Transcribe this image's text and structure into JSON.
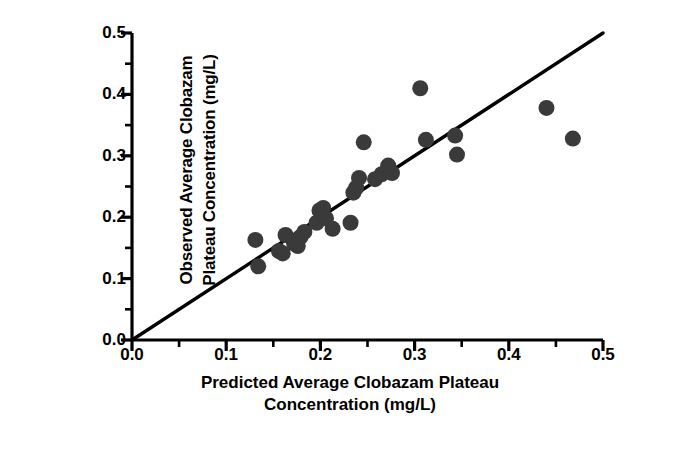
{
  "chart_data": {
    "type": "scatter",
    "title": "",
    "xlabel": "Predicted Average Clobazam Plateau Concentration (mg/L)",
    "xlabel_line1": "Predicted Average Clobazam Plateau",
    "xlabel_line2": "Concentration (mg/L)",
    "ylabel": "Observed Average Clobazam Plateau Concentration (mg/L)",
    "ylabel_line1": "Observed Average Clobazam",
    "ylabel_line2": "Plateau Concentration (mg/L)",
    "xlim": [
      0.0,
      0.5
    ],
    "ylim": [
      0.0,
      0.5
    ],
    "xticks": [
      "0.0",
      "0.1",
      "0.2",
      "0.3",
      "0.4",
      "0.5"
    ],
    "yticks": [
      "0.0",
      "0.1",
      "0.2",
      "0.3",
      "0.4",
      "0.5"
    ],
    "xtick_values": [
      0.0,
      0.1,
      0.2,
      0.3,
      0.4,
      0.5
    ],
    "ytick_values": [
      0.0,
      0.1,
      0.2,
      0.3,
      0.4,
      0.5
    ],
    "minor_tick_interval": 0.05,
    "grid": false,
    "legend": "none",
    "marker_color": "#3a3a3a",
    "marker_size": 11,
    "line_color": "#000000",
    "axis_color": "#000000",
    "reference_line": {
      "label": "line of identity",
      "x": [
        0.0,
        0.5
      ],
      "y": [
        0.0,
        0.5
      ],
      "slope": 1.0,
      "intercept": 0.0
    },
    "n_points": 27,
    "x": [
      0.131,
      0.134,
      0.156,
      0.16,
      0.163,
      0.172,
      0.176,
      0.179,
      0.183,
      0.196,
      0.199,
      0.203,
      0.206,
      0.213,
      0.232,
      0.235,
      0.238,
      0.241,
      0.246,
      0.258,
      0.265,
      0.272,
      0.276,
      0.306,
      0.312,
      0.343,
      0.345,
      0.44,
      0.468
    ],
    "y": [
      0.163,
      0.12,
      0.145,
      0.141,
      0.171,
      0.157,
      0.153,
      0.168,
      0.176,
      0.191,
      0.211,
      0.215,
      0.198,
      0.181,
      0.191,
      0.24,
      0.248,
      0.264,
      0.322,
      0.262,
      0.27,
      0.284,
      0.272,
      0.41,
      0.326,
      0.333,
      0.302,
      0.378,
      0.328
    ],
    "points": [
      {
        "x": 0.131,
        "y": 0.163
      },
      {
        "x": 0.134,
        "y": 0.12
      },
      {
        "x": 0.156,
        "y": 0.145
      },
      {
        "x": 0.16,
        "y": 0.141
      },
      {
        "x": 0.163,
        "y": 0.171
      },
      {
        "x": 0.172,
        "y": 0.157
      },
      {
        "x": 0.176,
        "y": 0.153
      },
      {
        "x": 0.179,
        "y": 0.168
      },
      {
        "x": 0.183,
        "y": 0.176
      },
      {
        "x": 0.196,
        "y": 0.191
      },
      {
        "x": 0.199,
        "y": 0.211
      },
      {
        "x": 0.203,
        "y": 0.215
      },
      {
        "x": 0.206,
        "y": 0.198
      },
      {
        "x": 0.213,
        "y": 0.181
      },
      {
        "x": 0.232,
        "y": 0.191
      },
      {
        "x": 0.235,
        "y": 0.24
      },
      {
        "x": 0.238,
        "y": 0.248
      },
      {
        "x": 0.241,
        "y": 0.264
      },
      {
        "x": 0.246,
        "y": 0.322
      },
      {
        "x": 0.258,
        "y": 0.262
      },
      {
        "x": 0.265,
        "y": 0.27
      },
      {
        "x": 0.272,
        "y": 0.284
      },
      {
        "x": 0.276,
        "y": 0.272
      },
      {
        "x": 0.306,
        "y": 0.41
      },
      {
        "x": 0.312,
        "y": 0.326
      },
      {
        "x": 0.343,
        "y": 0.333
      },
      {
        "x": 0.345,
        "y": 0.302
      },
      {
        "x": 0.44,
        "y": 0.378
      },
      {
        "x": 0.468,
        "y": 0.328
      }
    ]
  },
  "caption": {
    "text": ""
  }
}
